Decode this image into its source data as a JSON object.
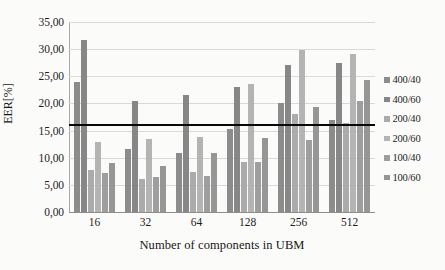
{
  "chart_data": {
    "type": "bar",
    "title": "",
    "subtitle": "",
    "xlabel": "Number of components in UBM",
    "ylabel": "EER[%]",
    "categories": [
      "16",
      "32",
      "64",
      "128",
      "256",
      "512"
    ],
    "series": [
      {
        "name": "400/40",
        "color": "#8c8c8c",
        "values": [
          23.9,
          11.6,
          10.9,
          15.3,
          20.0,
          17.0
        ]
      },
      {
        "name": "400/60",
        "color": "#878787",
        "values": [
          31.7,
          20.4,
          21.6,
          23.0,
          27.1,
          27.5
        ]
      },
      {
        "name": "200/40",
        "color": "#ababab",
        "values": [
          7.8,
          6.1,
          7.4,
          9.3,
          18.1,
          16.4
        ]
      },
      {
        "name": "200/60",
        "color": "#b4b4b4",
        "values": [
          12.9,
          13.4,
          13.9,
          23.6,
          29.8,
          29.2
        ]
      },
      {
        "name": "100/40",
        "color": "#9e9e9e",
        "values": [
          7.2,
          6.4,
          6.7,
          9.3,
          13.2,
          20.4
        ]
      },
      {
        "name": "100/60",
        "color": "#969696",
        "values": [
          9.1,
          8.4,
          10.8,
          13.7,
          19.4,
          24.4
        ]
      }
    ],
    "ylim": [
      0,
      35
    ],
    "yticks": [
      "0,00",
      "5,00",
      "10,00",
      "15,00",
      "20,00",
      "25,00",
      "30,00",
      "35,00"
    ],
    "ytick_values": [
      0,
      5,
      10,
      15,
      20,
      25,
      30,
      35
    ],
    "grid": true,
    "legend_position": "right",
    "annotations": [
      {
        "type": "hline",
        "label": "reference-threshold",
        "value": 16.1,
        "color": "#080808"
      }
    ]
  },
  "ghost_text": {
    "line1": "",
    "line2": "",
    "line3": ""
  }
}
